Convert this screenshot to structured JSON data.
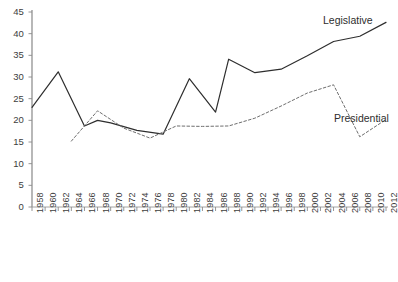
{
  "chart_data": {
    "type": "line",
    "title": "",
    "subtitle": "",
    "xlabel": "",
    "ylabel": "",
    "xlim": [
      1958,
      2012
    ],
    "ylim": [
      0,
      45
    ],
    "grid": false,
    "legend_position": "inline-right",
    "y_ticks": [
      0,
      5,
      10,
      15,
      20,
      25,
      30,
      35,
      40,
      45
    ],
    "y_tick_labels": [
      "0",
      "5",
      "10",
      "15",
      "20",
      "25",
      "30",
      "35",
      "40",
      "45"
    ],
    "x_tick_labels": [
      "1958",
      "1960",
      "1962",
      "1964",
      "1966",
      "1968",
      "1970",
      "1972",
      "1974",
      "1976",
      "1978",
      "1980",
      "1982",
      "1984",
      "1986",
      "1988",
      "1990",
      "1992",
      "1994",
      "1996",
      "1998",
      "2000",
      "2002",
      "2004",
      "2006",
      "2008",
      "2010",
      "2012"
    ],
    "x": [
      1958,
      1960,
      1962,
      1964,
      1966,
      1968,
      1970,
      1972,
      1974,
      1976,
      1978,
      1980,
      1982,
      1984,
      1986,
      1988,
      1990,
      1992,
      1994,
      1996,
      1998,
      2000,
      2002,
      2004,
      2006,
      2008,
      2010,
      2012
    ],
    "series": [
      {
        "name": "Legislative",
        "style": "solid",
        "color": "#2e2e2e",
        "x": [
          1958,
          1962,
          1966,
          1968,
          1970,
          1974,
          1978,
          1982,
          1986,
          1988,
          1992,
          1996,
          2000,
          2004,
          2008,
          2012
        ],
        "values": [
          23.0,
          31.2,
          18.7,
          20.0,
          19.4,
          17.7,
          16.8,
          29.6,
          21.9,
          34.1,
          31.0,
          31.8,
          34.9,
          38.2,
          39.4,
          42.6
        ]
      },
      {
        "name": "Presidential",
        "style": "dashed",
        "color": "#6e6e6e",
        "x": [
          1964,
          1968,
          1972,
          1976,
          1980,
          1984,
          1988,
          1992,
          1996,
          2000,
          2004,
          2008,
          2012
        ],
        "values": [
          15.2,
          22.2,
          18.2,
          15.9,
          18.7,
          18.6,
          18.7,
          20.5,
          23.3,
          26.3,
          28.2,
          16.2,
          20.2
        ]
      }
    ],
    "annotations": [
      {
        "text": "Legislative",
        "series": "Legislative"
      },
      {
        "text": "Presidential",
        "series": "Presidential"
      }
    ]
  },
  "labels": {
    "legislative": "Legislative",
    "presidential": "Presidential"
  }
}
